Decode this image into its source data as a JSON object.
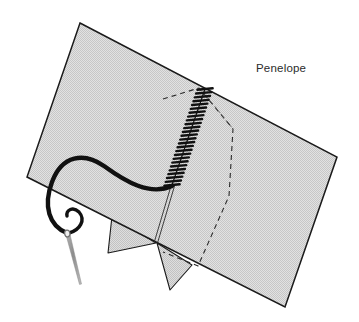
{
  "figure": {
    "title": "Penelope",
    "background_color": "#ffffff"
  },
  "caption": {
    "label": "Penelope",
    "x": 256,
    "y": 72,
    "color": "#2b2b2b",
    "font_size_px": 11.5
  },
  "fabric": {
    "name": "fabric-sheet",
    "fill_color": "#dcdcdc",
    "texture": "fine-checker-dither",
    "texture_color": "#c9c9c9",
    "outline_color": "#1a1a1a",
    "outline_width": 1.4,
    "corners": [
      {
        "x": 80,
        "y": 23
      },
      {
        "x": 337,
        "y": 157
      },
      {
        "x": 285,
        "y": 307
      },
      {
        "x": 27,
        "y": 177
      }
    ]
  },
  "hidden_outline": {
    "name": "dashed-hidden-outline",
    "stroke_color": "#2a2a2a",
    "stroke_width": 1.1,
    "dash_pattern": "5 4",
    "points": [
      {
        "x": 163,
        "y": 99
      },
      {
        "x": 199,
        "y": 88
      },
      {
        "x": 233,
        "y": 129
      },
      {
        "x": 229,
        "y": 196
      },
      {
        "x": 198,
        "y": 266
      },
      {
        "x": 163,
        "y": 252
      }
    ]
  },
  "fold_crease": {
    "name": "fold-crease-lines",
    "stroke_color": "#2a2a2a",
    "stroke_width": 0.9,
    "lines": [
      {
        "x1": 171,
        "y1": 186,
        "x2": 154,
        "y2": 243
      },
      {
        "x1": 174,
        "y1": 186,
        "x2": 157,
        "y2": 243
      }
    ]
  },
  "flaps": {
    "name": "fabric-flaps",
    "fill_color": "#d4d4d4",
    "outline_color": "#1a1a1a",
    "outline_width": 1.1,
    "left_flap": [
      {
        "x": 112,
        "y": 216
      },
      {
        "x": 156,
        "y": 243
      },
      {
        "x": 108,
        "y": 253
      }
    ],
    "right_flap": [
      {
        "x": 157,
        "y": 243
      },
      {
        "x": 192,
        "y": 265
      },
      {
        "x": 170,
        "y": 290
      }
    ]
  },
  "seam_stitching": {
    "name": "whipstitch-seam",
    "stroke_color": "#111111",
    "stitch_count": 26,
    "start": {
      "x": 205,
      "y": 89
    },
    "end": {
      "x": 172,
      "y": 185
    },
    "stitch_half_width": 7,
    "stroke_width": 2.4
  },
  "thread": {
    "name": "thread-strand",
    "stroke_color": "#111111",
    "stroke_width": 4.2,
    "path_description": "S-curve from seam base left across fabric then down to needle eye",
    "from": {
      "x": 172,
      "y": 186
    },
    "to": {
      "x": 68,
      "y": 233
    }
  },
  "needle": {
    "name": "sewing-needle",
    "body_color": "#9a9a9a",
    "eye_color": "#6f6f6f",
    "tip": {
      "x": 81,
      "y": 284
    },
    "eye": {
      "x": 67,
      "y": 232
    }
  }
}
